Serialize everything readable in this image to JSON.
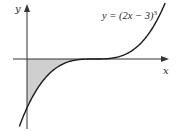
{
  "figure": {
    "y_axis_label": "y",
    "x_axis_label": "x",
    "equation_label": {
      "prefix": "y = (2x − 3)",
      "exponent": "3"
    }
  },
  "colors": {
    "curve": "#1a1a1a",
    "axes": "#333333",
    "shade": "#cfcfcf"
  },
  "chart_data": {
    "type": "line",
    "title": "",
    "function": "y = (2x - 3)^3",
    "xlabel": "x",
    "ylabel": "y",
    "annotations": [
      "y = (2x − 3)^3"
    ],
    "shaded_region": {
      "description": "Area bounded by the curve, the x-axis and the y-axis (between x = 0 and x = 1.5)",
      "x_from": 0,
      "x_to": 1.5
    },
    "key_points": [
      {
        "x": 0,
        "y": -27,
        "note": "y-intercept"
      },
      {
        "x": 1.5,
        "y": 0,
        "note": "x-intercept / stationary point of inflection"
      }
    ],
    "grid": false,
    "ticks": false
  }
}
